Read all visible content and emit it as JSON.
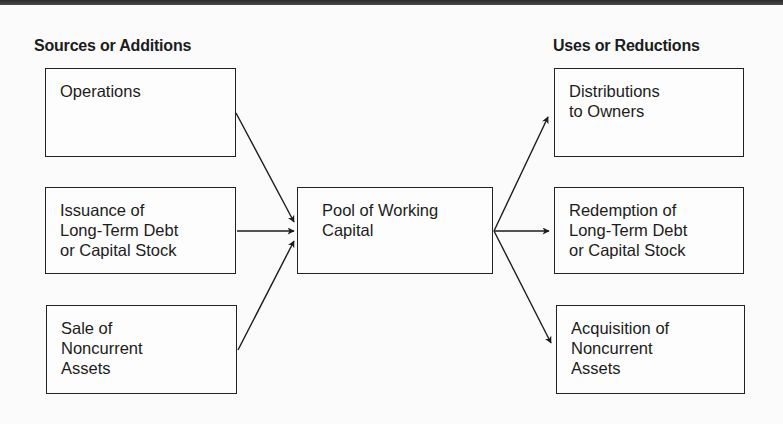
{
  "diagram": {
    "headings": {
      "left": "Sources or Additions",
      "right": "Uses or Reductions"
    },
    "sources": [
      {
        "id": "operations",
        "label": "Operations"
      },
      {
        "id": "issuance",
        "label": "Issuance of\nLong-Term Debt\nor Capital Stock"
      },
      {
        "id": "sale",
        "label": "Sale of\nNoncurrent\nAssets"
      }
    ],
    "center": {
      "id": "pool",
      "label": "Pool of Working\nCapital"
    },
    "uses": [
      {
        "id": "distributions",
        "label": "Distributions\nto Owners"
      },
      {
        "id": "redemption",
        "label": "Redemption of\nLong-Term Debt\nor Capital Stock"
      },
      {
        "id": "acquisition",
        "label": "Acquisition of\nNoncurrent\nAssets"
      }
    ],
    "edges": [
      {
        "from": "operations",
        "to": "pool"
      },
      {
        "from": "issuance",
        "to": "pool"
      },
      {
        "from": "sale",
        "to": "pool"
      },
      {
        "from": "pool",
        "to": "distributions"
      },
      {
        "from": "pool",
        "to": "redemption"
      },
      {
        "from": "pool",
        "to": "acquisition"
      }
    ]
  }
}
